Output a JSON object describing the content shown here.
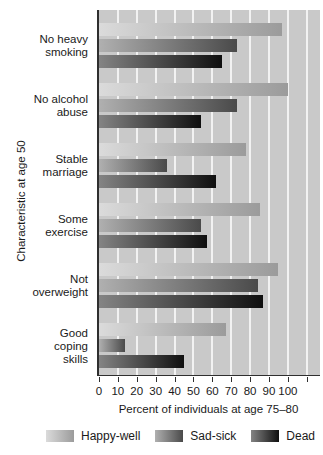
{
  "chart_data": {
    "type": "bar",
    "orientation": "horizontal",
    "xlabel": "Percent of individuals at age 75–80",
    "ylabel": "Characteristic at age 50",
    "xlim": [
      0,
      117
    ],
    "xticks": [
      0,
      10,
      20,
      30,
      40,
      50,
      60,
      70,
      80,
      90,
      100
    ],
    "grid": true,
    "gridline_step": 10,
    "legend_position": "bottom",
    "categories": [
      "No heavy smoking",
      "No alcohol abuse",
      "Stable marriage",
      "Some exercise",
      "Not overweight",
      "Good coping skills"
    ],
    "category_label_lines": [
      [
        "No heavy",
        "smoking"
      ],
      [
        "No alcohol",
        "abuse"
      ],
      [
        "Stable",
        "marriage"
      ],
      [
        "Some",
        "exercise"
      ],
      [
        "Not",
        "overweight"
      ],
      [
        "Good",
        "coping",
        "skills"
      ]
    ],
    "series": [
      {
        "name": "Happy-well",
        "values": [
          97,
          100,
          78,
          85,
          95,
          67
        ],
        "color_start": "#dbdbdb",
        "color_end": "#9b9b9b"
      },
      {
        "name": "Sad-sick",
        "values": [
          73,
          73,
          36,
          54,
          84,
          14
        ],
        "color_start": "#b0b0b0",
        "color_end": "#4a4a4a"
      },
      {
        "name": "Dead",
        "values": [
          65,
          54,
          62,
          57,
          87,
          45
        ],
        "color_start": "#848484",
        "color_end": "#0f0f0f"
      }
    ],
    "plot_background": "#c9c9c9",
    "gridline_color": "#f2f2f2",
    "axis_color": "#2f2f2f",
    "text_color": "#1a1a1a"
  }
}
